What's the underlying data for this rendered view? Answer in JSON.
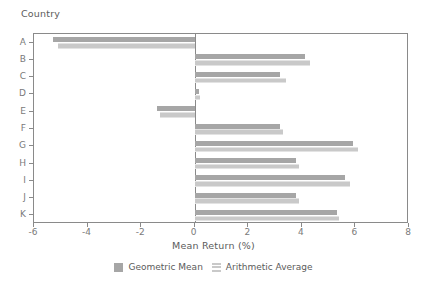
{
  "chart_data": {
    "type": "bar",
    "orientation": "horizontal",
    "title": "",
    "xlabel": "Mean Return (%)",
    "ylabel": "Country",
    "xlim": [
      -6,
      8
    ],
    "ylim_categories": [
      "A",
      "B",
      "C",
      "D",
      "E",
      "F",
      "G",
      "H",
      "I",
      "J",
      "K"
    ],
    "xticks": [
      -6,
      -4,
      -2,
      0,
      2,
      4,
      6,
      8
    ],
    "xtick_labels": [
      "-6",
      "-4",
      "-2",
      "0",
      "2",
      "4",
      "6",
      "8"
    ],
    "grid": false,
    "legend_position": "bottom",
    "categories": [
      "A",
      "B",
      "C",
      "D",
      "E",
      "F",
      "G",
      "H",
      "I",
      "J",
      "K"
    ],
    "series": [
      {
        "name": "Geometric Mean",
        "color": "#a6a6a6",
        "values": [
          -5.3,
          4.1,
          3.2,
          0.15,
          -1.4,
          3.2,
          5.9,
          3.8,
          5.6,
          3.8,
          5.3
        ]
      },
      {
        "name": "Arithmetic Average",
        "color": "#c9c9c9",
        "values": [
          -5.1,
          4.3,
          3.4,
          0.2,
          -1.3,
          3.3,
          6.1,
          3.9,
          5.8,
          3.9,
          5.4
        ]
      }
    ]
  },
  "legend": {
    "items": [
      {
        "label": "Geometric Mean",
        "swatch": "solid-swatch-icon"
      },
      {
        "label": "Arithmetic Average",
        "swatch": "striped-swatch-icon"
      }
    ]
  },
  "axes": {
    "y_axis_title": "Country",
    "x_axis_title": "Mean Return (%)"
  },
  "colors": {
    "geometric": "#a6a6a6",
    "arithmetic": "#c9c9c9",
    "axis": "#8a8a8a",
    "text": "#5b5b5b",
    "tick_text": "#7a7a7a",
    "background": "#ffffff"
  }
}
